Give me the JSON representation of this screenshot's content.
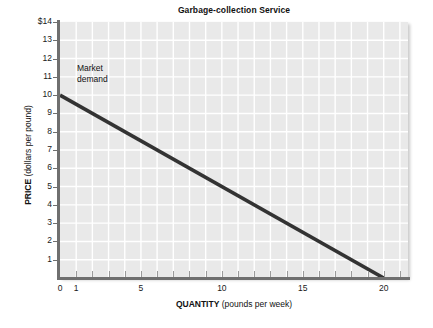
{
  "chart_data": {
    "type": "line",
    "title": "Garbage-collection Service",
    "xlabel_bold": "QUANTITY",
    "xlabel_rest": " (pounds per week)",
    "ylabel_bold": "PRICE",
    "ylabel_rest": " (dollars per pound)",
    "xlim": [
      0,
      21.5
    ],
    "ylim": [
      0,
      14
    ],
    "grid": true,
    "grid_color": "#ffffff",
    "plot_background": "#e9e9e9",
    "legend_position": "inline-annotation",
    "x_ticks_major": [
      0,
      1,
      5,
      10,
      15,
      20
    ],
    "x_tick_labels": [
      "0",
      "1",
      "5",
      "10",
      "15",
      "20"
    ],
    "x_ticks_minor": [
      0,
      1,
      2,
      3,
      4,
      5,
      6,
      7,
      8,
      9,
      10,
      11,
      12,
      13,
      14,
      15,
      16,
      17,
      18,
      19,
      20,
      21
    ],
    "y_ticks": [
      1,
      2,
      3,
      4,
      5,
      6,
      7,
      8,
      9,
      10,
      11,
      12,
      13,
      14
    ],
    "y_tick_labels": [
      "1",
      "2",
      "3",
      "4",
      "5",
      "6",
      "7",
      "8",
      "9",
      "10",
      "11",
      "12",
      "13",
      "$14"
    ],
    "series": [
      {
        "name": "Market demand",
        "color": "#333333",
        "width": 3.6,
        "label_line1": "Market",
        "label_line2": "demand",
        "label_x": 1.05,
        "label_y": 11.5,
        "points": [
          {
            "x": 0,
            "y": 10
          },
          {
            "x": 20,
            "y": 0
          }
        ],
        "equation": "P = 10 - 0.5 Q",
        "x_intercept": 20,
        "y_intercept": 10
      }
    ]
  }
}
